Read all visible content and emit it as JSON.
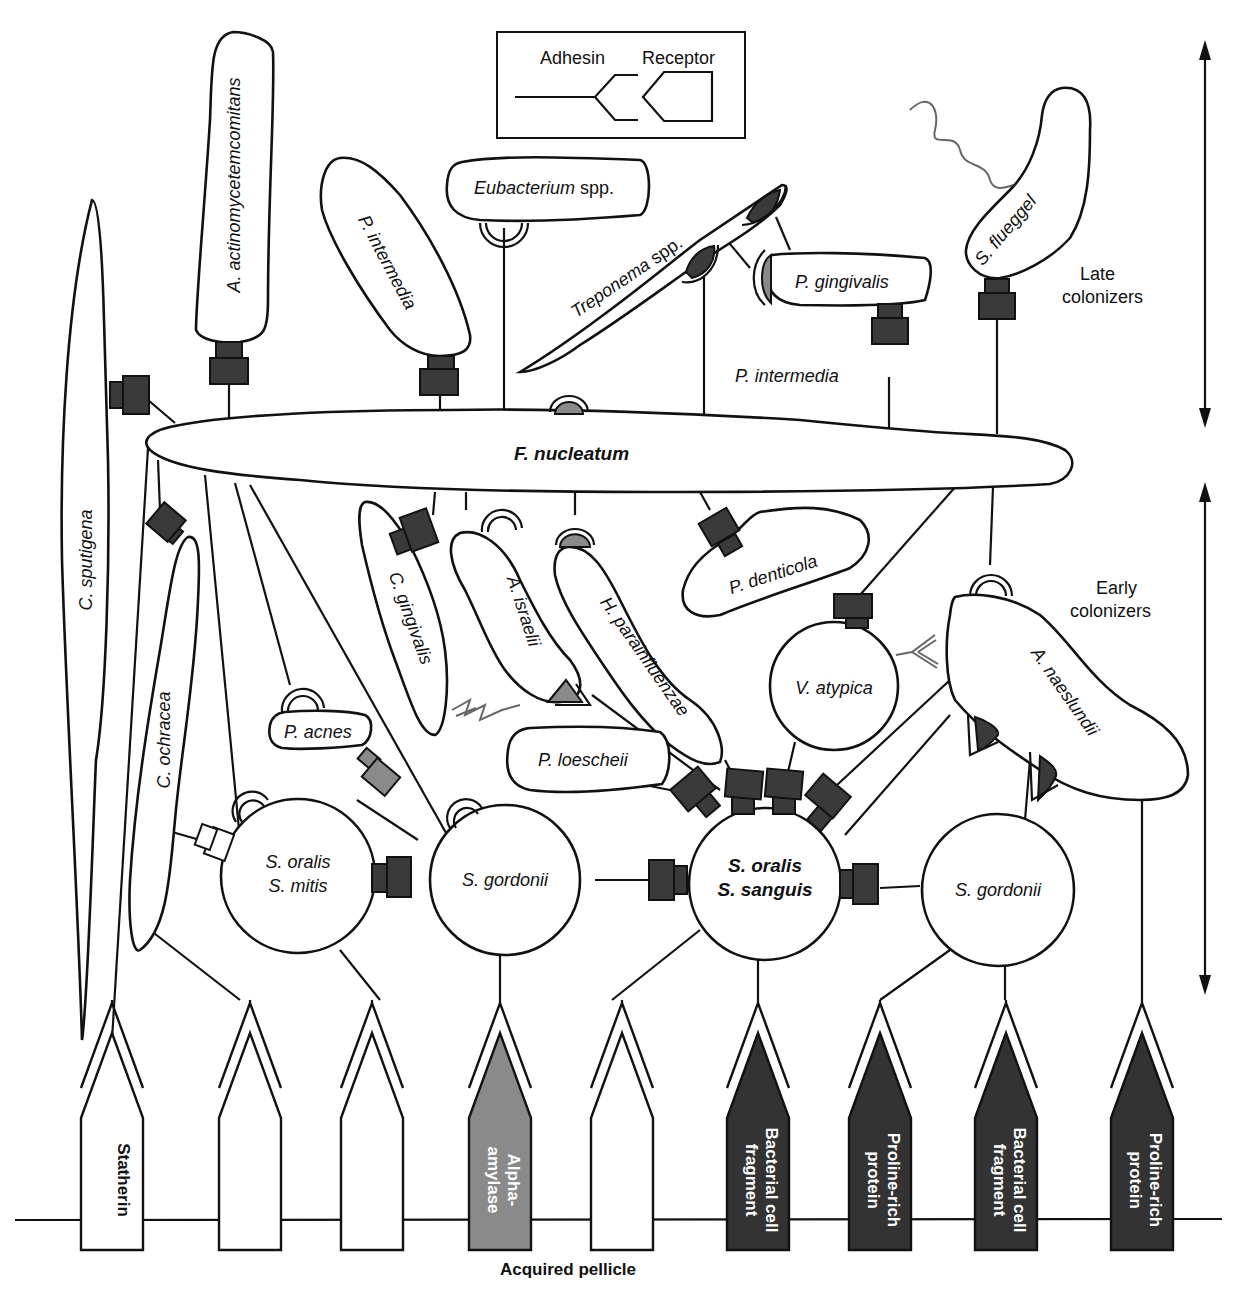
{
  "legend": {
    "adhesin_label": "Adhesin",
    "receptor_label": "Receptor"
  },
  "axis": {
    "late_label_line1": "Late",
    "late_label_line2": "colonizers",
    "early_label_line1": "Early",
    "early_label_line2": "colonizers"
  },
  "late_colonizers": {
    "a_actino": "A. actinomycetemcomitans",
    "p_intermedia_cell": "P. intermedia",
    "eubacterium": "Eubacterium",
    "eubacterium_suffix": " spp.",
    "treponema": "Treponema",
    "treponema_suffix": " spp.",
    "p_gingivalis": "P. gingivalis",
    "s_flueggel": "S. flueggel",
    "p_intermedia_text": "P. intermedia",
    "c_sputigena": "C. sputigena"
  },
  "bridge": {
    "f_nucleatum": "F. nucleatum"
  },
  "early_colonizers": {
    "c_ochracea": "C. ochracea",
    "c_gingivalis": "C. gingivalis",
    "a_israelii": "A. israelii",
    "h_parainfluenzae": "H. parainfluenzae",
    "p_denticola": "P. denticola",
    "v_atypica": "V. atypica",
    "a_naeslundii": "A. naeslundii",
    "p_acnes": "P. acnes",
    "p_loescheii": "P. loescheii",
    "s_oralis_mitis_1": "S. oralis",
    "s_oralis_mitis_2": "S. mitis",
    "s_gordonii_left": "S. gordonii",
    "s_oralis_sanguis_1": "S. oralis",
    "s_oralis_sanguis_2": "S. sanguis",
    "s_gordonii_right": "S. gordonii"
  },
  "pellicle": {
    "title": "Acquired pellicle",
    "receptors": [
      {
        "label1": "Statherin",
        "label2": "",
        "fill": "#ffffff",
        "text_color": "#111111"
      },
      {
        "label1": "",
        "label2": "",
        "fill": "#ffffff",
        "text_color": "#111111"
      },
      {
        "label1": "",
        "label2": "",
        "fill": "#ffffff",
        "text_color": "#111111"
      },
      {
        "label1": "Alpha-",
        "label2": "amylase",
        "fill": "#8a8a8a",
        "text_color": "#ffffff"
      },
      {
        "label1": "",
        "label2": "",
        "fill": "#ffffff",
        "text_color": "#111111"
      },
      {
        "label1": "Bacterial cell",
        "label2": "fragment",
        "fill": "#333333",
        "text_color": "#ffffff"
      },
      {
        "label1": "Proline-rich",
        "label2": "protein",
        "fill": "#333333",
        "text_color": "#ffffff"
      },
      {
        "label1": "Bacterial cell",
        "label2": "fragment",
        "fill": "#333333",
        "text_color": "#ffffff"
      },
      {
        "label1": "Proline-rich",
        "label2": "protein",
        "fill": "#333333",
        "text_color": "#ffffff"
      }
    ]
  },
  "colors": {
    "dark_adhesin": "#3a3a3a",
    "gray_adhesin": "#8a8a8a",
    "line": "#111111"
  }
}
